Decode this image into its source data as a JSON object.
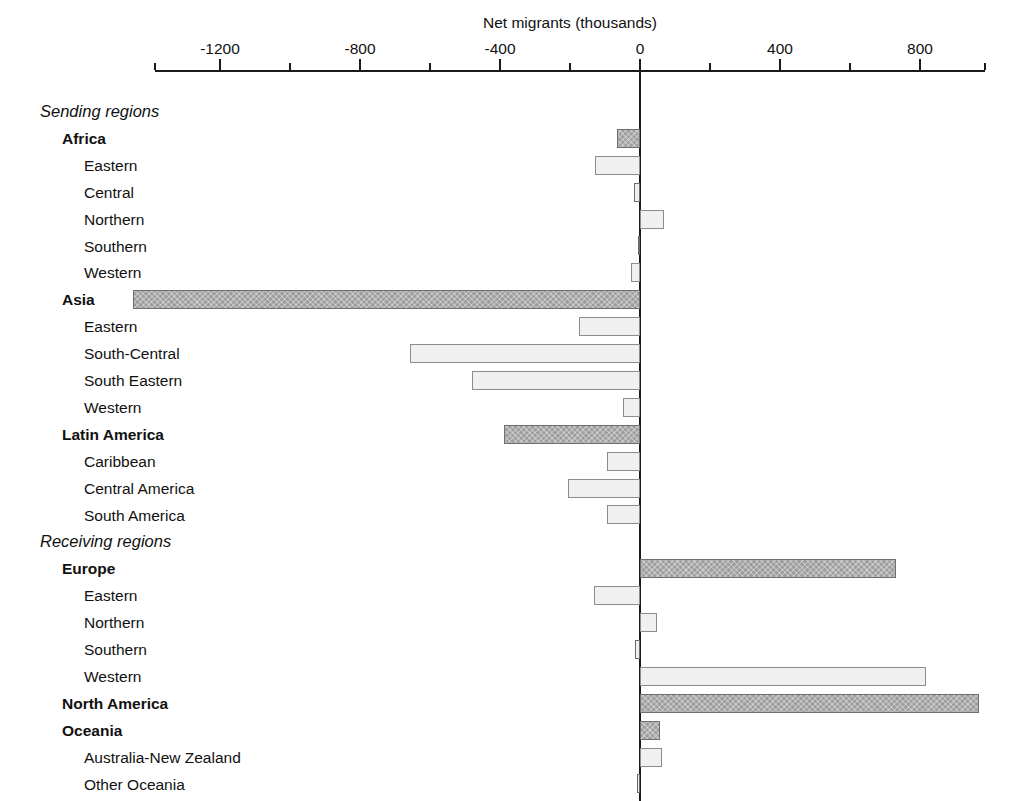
{
  "chart_data": {
    "type": "bar",
    "orientation": "horizontal",
    "title": "Net migrants (thousands)",
    "xlabel": "Net migrants (thousands)",
    "ylabel": "",
    "xlim": [
      -1450,
      1030
    ],
    "axis_ticks_major": [
      -1200,
      -800,
      -400,
      0,
      400,
      800
    ],
    "axis_tick_labels": [
      "-1200",
      "-800",
      "-400",
      "0",
      "400",
      "800"
    ],
    "axis_minor_step": 200,
    "grid": false,
    "legend": null,
    "categories": [
      "Sending regions",
      "Africa",
      "Eastern",
      "Central",
      "Northern",
      "Southern",
      "Western",
      "Asia",
      "Eastern",
      "South-Central",
      "South Eastern",
      "Western",
      "Latin America",
      "Caribbean",
      "Central America",
      "South America",
      "Receiving regions",
      "Europe",
      "Eastern",
      "Northern",
      "Southern",
      "Western",
      "North America",
      "Oceania",
      "Australia-New Zealand",
      "Other Oceania"
    ],
    "values": [
      null,
      -66,
      -129,
      -17,
      69,
      -6,
      -26,
      -1450,
      -174,
      -657,
      -480,
      -49,
      -389,
      -94,
      -206,
      -94,
      null,
      731,
      -131,
      49,
      -14,
      817,
      969,
      56,
      63,
      -9
    ],
    "rows": [
      {
        "label": "Sending regions",
        "level": "header",
        "value": null,
        "style": null
      },
      {
        "label": "Africa",
        "level": "major",
        "value": -66,
        "style": "dark"
      },
      {
        "label": "Eastern",
        "level": "sub",
        "value": -129,
        "style": "light"
      },
      {
        "label": "Central",
        "level": "sub",
        "value": -17,
        "style": "light"
      },
      {
        "label": "Northern",
        "level": "sub",
        "value": 69,
        "style": "light"
      },
      {
        "label": "Southern",
        "level": "sub",
        "value": -6,
        "style": "light"
      },
      {
        "label": "Western",
        "level": "sub",
        "value": -26,
        "style": "light"
      },
      {
        "label": "Asia",
        "level": "major",
        "value": -1450,
        "style": "dark"
      },
      {
        "label": "Eastern",
        "level": "sub",
        "value": -174,
        "style": "light"
      },
      {
        "label": "South-Central",
        "level": "sub",
        "value": -657,
        "style": "light"
      },
      {
        "label": "South Eastern",
        "level": "sub",
        "value": -480,
        "style": "light"
      },
      {
        "label": "Western",
        "level": "sub",
        "value": -49,
        "style": "light"
      },
      {
        "label": "Latin America",
        "level": "major",
        "value": -389,
        "style": "dark"
      },
      {
        "label": "Caribbean",
        "level": "sub",
        "value": -94,
        "style": "light"
      },
      {
        "label": "Central America",
        "level": "sub",
        "value": -206,
        "style": "light"
      },
      {
        "label": "South America",
        "level": "sub",
        "value": -94,
        "style": "light"
      },
      {
        "label": "Receiving regions",
        "level": "header",
        "value": null,
        "style": null
      },
      {
        "label": "Europe",
        "level": "major",
        "value": 731,
        "style": "dark"
      },
      {
        "label": "Eastern",
        "level": "sub",
        "value": -131,
        "style": "light"
      },
      {
        "label": "Northern",
        "level": "sub",
        "value": 49,
        "style": "light"
      },
      {
        "label": "Southern",
        "level": "sub",
        "value": -14,
        "style": "light"
      },
      {
        "label": "Western",
        "level": "sub",
        "value": 817,
        "style": "light"
      },
      {
        "label": "North America",
        "level": "major",
        "value": 969,
        "style": "dark"
      },
      {
        "label": "Oceania",
        "level": "major",
        "value": 56,
        "style": "dark"
      },
      {
        "label": "Australia-New Zealand",
        "level": "sub",
        "value": 63,
        "style": "light"
      },
      {
        "label": "Other Oceania",
        "level": "sub",
        "value": -9,
        "style": "light"
      }
    ]
  },
  "colors": {
    "dark_bar": "#9d9d9d",
    "light_bar": "#f0f0f0",
    "bar_border": "#808080",
    "axis": "#1a1a1a",
    "text": "#111111",
    "background": "#ffffff"
  }
}
